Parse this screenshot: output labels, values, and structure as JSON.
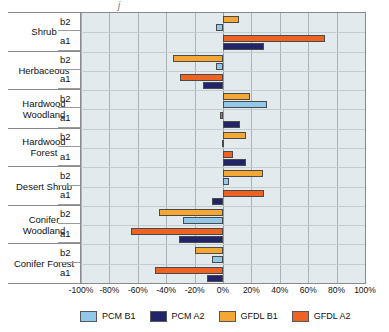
{
  "chart_data": {
    "type": "bar",
    "orientation": "horizontal",
    "title": "",
    "xlabel": "",
    "ylabel": "",
    "xlim": [
      -100,
      100
    ],
    "xticks": [
      -100,
      -80,
      -60,
      -40,
      -20,
      0,
      20,
      40,
      60,
      80,
      100
    ],
    "xtick_labels": [
      "-100%",
      "-80%",
      "-60%",
      "-40%",
      "-20%",
      "0%",
      "20%",
      "40%",
      "60%",
      "80%",
      "100%"
    ],
    "grid": true,
    "legend_position": "bottom",
    "categories": [
      "Shrub",
      "Herbaceous",
      "Hardwood Woodland",
      "Hardwood Forest",
      "Desert Shrub",
      "Conifer Woodland",
      "Conifer Forest"
    ],
    "subgroups": [
      "b2",
      "a1"
    ],
    "series": [
      {
        "name": "PCM B1",
        "color": "#93c9e8",
        "scenario": "b2",
        "values": [
          -5,
          -5,
          31,
          -1,
          4,
          -28,
          -8
        ]
      },
      {
        "name": "PCM A2",
        "color": "#22246a",
        "scenario": "a1",
        "values": [
          29,
          -14,
          12,
          16,
          -8,
          -31,
          -11
        ]
      },
      {
        "name": "GFDL B1",
        "color": "#f5a733",
        "scenario": "b2",
        "values": [
          11,
          -35,
          19,
          16,
          28,
          -45,
          -20
        ]
      },
      {
        "name": "GFDL A2",
        "color": "#ef6322",
        "scenario": "a1",
        "values": [
          72,
          -30,
          -2,
          7,
          29,
          -65,
          -48
        ]
      }
    ],
    "rows": [
      {
        "category": "Shrub",
        "sub": "b2",
        "bars": [
          {
            "series": "GFDL B1",
            "value": 11
          },
          {
            "series": "PCM B1",
            "value": -5
          }
        ]
      },
      {
        "category": "Shrub",
        "sub": "a1",
        "bars": [
          {
            "series": "GFDL A2",
            "value": 72
          },
          {
            "series": "PCM A2",
            "value": 29
          }
        ]
      },
      {
        "category": "Herbaceous",
        "sub": "b2",
        "bars": [
          {
            "series": "GFDL B1",
            "value": -35
          },
          {
            "series": "PCM B1",
            "value": -5
          }
        ]
      },
      {
        "category": "Herbaceous",
        "sub": "a1",
        "bars": [
          {
            "series": "GFDL A2",
            "value": -30
          },
          {
            "series": "PCM A2",
            "value": -14
          }
        ]
      },
      {
        "category": "Hardwood Woodland",
        "sub": "b2",
        "bars": [
          {
            "series": "GFDL B1",
            "value": 19
          },
          {
            "series": "PCM B1",
            "value": 31
          }
        ]
      },
      {
        "category": "Hardwood Woodland",
        "sub": "a1",
        "bars": [
          {
            "series": "GFDL A2",
            "value": -2
          },
          {
            "series": "PCM A2",
            "value": 12
          }
        ]
      },
      {
        "category": "Hardwood Forest",
        "sub": "b2",
        "bars": [
          {
            "series": "GFDL B1",
            "value": 16
          },
          {
            "series": "PCM B1",
            "value": -1
          }
        ]
      },
      {
        "category": "Hardwood Forest",
        "sub": "a1",
        "bars": [
          {
            "series": "GFDL A2",
            "value": 7
          },
          {
            "series": "PCM A2",
            "value": 16
          }
        ]
      },
      {
        "category": "Desert Shrub",
        "sub": "b2",
        "bars": [
          {
            "series": "GFDL B1",
            "value": 28
          },
          {
            "series": "PCM B1",
            "value": 4
          }
        ]
      },
      {
        "category": "Desert Shrub",
        "sub": "a1",
        "bars": [
          {
            "series": "GFDL A2",
            "value": 29
          },
          {
            "series": "PCM A2",
            "value": -8
          }
        ]
      },
      {
        "category": "Conifer Woodland",
        "sub": "b2",
        "bars": [
          {
            "series": "GFDL B1",
            "value": -45
          },
          {
            "series": "PCM B1",
            "value": -28
          }
        ]
      },
      {
        "category": "Conifer Woodland",
        "sub": "a1",
        "bars": [
          {
            "series": "GFDL A2",
            "value": -65
          },
          {
            "series": "PCM A2",
            "value": -31
          }
        ]
      },
      {
        "category": "Conifer Forest",
        "sub": "b2",
        "bars": [
          {
            "series": "GFDL B1",
            "value": -20
          },
          {
            "series": "PCM B1",
            "value": -8
          }
        ]
      },
      {
        "category": "Conifer Forest",
        "sub": "a1",
        "bars": [
          {
            "series": "GFDL A2",
            "value": -48
          },
          {
            "series": "PCM A2",
            "value": -11
          }
        ]
      }
    ]
  },
  "legend": {
    "items": [
      {
        "label": "PCM B1",
        "color": "#93c9e8"
      },
      {
        "label": "PCM A2",
        "color": "#22246a"
      },
      {
        "label": "GFDL B1",
        "color": "#f5a733"
      },
      {
        "label": "GFDL A2",
        "color": "#ef6322"
      }
    ]
  },
  "colors": {
    "plot_background": "#e3eaee",
    "gridline": "#a9b4ba",
    "axis": "#8a8a8a",
    "pcm_b1": "#93c9e8",
    "pcm_a2": "#22246a",
    "gfdl_b1": "#f5a733",
    "gfdl_a2": "#ef6322"
  }
}
